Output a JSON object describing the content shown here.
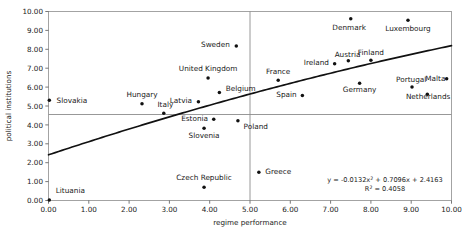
{
  "chart_data": {
    "type": "scatter",
    "title": "",
    "xlabel": "regime performance",
    "ylabel": "political institutions",
    "xlim": [
      0,
      10
    ],
    "ylim": [
      0,
      10
    ],
    "xticks": [
      "0.00",
      "1.00",
      "2.00",
      "3.00",
      "4.00",
      "5.00",
      "6.00",
      "7.00",
      "8.00",
      "9.00",
      "10.00"
    ],
    "yticks": [
      "0.00",
      "1.00",
      "2.00",
      "3.00",
      "4.00",
      "5.00",
      "6.00",
      "7.00",
      "8.00",
      "9.00",
      "10.00"
    ],
    "grid": false,
    "legend": "none",
    "points": [
      {
        "label": "Lituania",
        "x": 0.02,
        "y": 0.02,
        "lx": 0.18,
        "ly": 0.52,
        "anchor": "start"
      },
      {
        "label": "Slovakia",
        "x": 0.02,
        "y": 5.3,
        "lx": 0.2,
        "ly": 5.3,
        "anchor": "start"
      },
      {
        "label": "Hungary",
        "x": 2.32,
        "y": 5.12,
        "lx": 2.32,
        "ly": 5.62,
        "anchor": "middle"
      },
      {
        "label": "Italy",
        "x": 2.86,
        "y": 4.62,
        "lx": 2.9,
        "ly": 5.08,
        "anchor": "middle"
      },
      {
        "label": "Latvia",
        "x": 3.72,
        "y": 5.22,
        "lx": 3.56,
        "ly": 5.27,
        "anchor": "end"
      },
      {
        "label": "Estonia",
        "x": 4.1,
        "y": 4.3,
        "lx": 3.96,
        "ly": 4.36,
        "anchor": "end"
      },
      {
        "label": "Slovenia",
        "x": 3.86,
        "y": 3.82,
        "lx": 3.86,
        "ly": 3.42,
        "anchor": "middle"
      },
      {
        "label": "Czech Republic",
        "x": 3.86,
        "y": 0.7,
        "lx": 3.86,
        "ly": 1.22,
        "anchor": "middle"
      },
      {
        "label": "Poland",
        "x": 4.7,
        "y": 4.22,
        "lx": 4.84,
        "ly": 3.92,
        "anchor": "start"
      },
      {
        "label": "United Kingdom",
        "x": 3.96,
        "y": 6.48,
        "lx": 3.96,
        "ly": 6.96,
        "anchor": "middle"
      },
      {
        "label": "Belgium",
        "x": 4.24,
        "y": 5.72,
        "lx": 4.4,
        "ly": 5.9,
        "anchor": "start"
      },
      {
        "label": "Sweden",
        "x": 4.66,
        "y": 8.18,
        "lx": 4.5,
        "ly": 8.24,
        "anchor": "end"
      },
      {
        "label": "Greece",
        "x": 5.22,
        "y": 1.5,
        "lx": 5.38,
        "ly": 1.54,
        "anchor": "start"
      },
      {
        "label": "France",
        "x": 5.7,
        "y": 6.36,
        "lx": 5.7,
        "ly": 6.82,
        "anchor": "middle"
      },
      {
        "label": "Spain",
        "x": 6.3,
        "y": 5.56,
        "lx": 6.16,
        "ly": 5.6,
        "anchor": "end"
      },
      {
        "label": "Ireland",
        "x": 7.1,
        "y": 7.24,
        "lx": 6.96,
        "ly": 7.28,
        "anchor": "end"
      },
      {
        "label": "Austria",
        "x": 7.44,
        "y": 7.4,
        "lx": 7.42,
        "ly": 7.72,
        "anchor": "middle"
      },
      {
        "label": "Denmark",
        "x": 7.5,
        "y": 9.62,
        "lx": 7.46,
        "ly": 9.16,
        "anchor": "middle"
      },
      {
        "label": "Finland",
        "x": 8.0,
        "y": 7.42,
        "lx": 8.0,
        "ly": 7.84,
        "anchor": "middle"
      },
      {
        "label": "Germany",
        "x": 7.72,
        "y": 6.2,
        "lx": 7.72,
        "ly": 5.86,
        "anchor": "middle"
      },
      {
        "label": "Luxembourg",
        "x": 8.92,
        "y": 9.54,
        "lx": 8.92,
        "ly": 9.08,
        "anchor": "middle"
      },
      {
        "label": "Portugal",
        "x": 9.02,
        "y": 6.0,
        "lx": 9.0,
        "ly": 6.4,
        "anchor": "middle"
      },
      {
        "label": "Malta",
        "x": 9.88,
        "y": 6.44,
        "lx": 9.6,
        "ly": 6.44,
        "anchor": "middle"
      },
      {
        "label": "Netherlands",
        "x": 9.4,
        "y": 5.62,
        "lx": 9.42,
        "ly": 5.5,
        "anchor": "middle"
      }
    ],
    "trendline": {
      "equation": "y = -0.0132x² + 0.7096x + 2.4163",
      "r_squared": "R² = 0.4058",
      "coefficients": {
        "a": -0.0132,
        "b": 0.7096,
        "c": 2.4163
      },
      "r2_value": 0.4058
    },
    "reference_lines": {
      "horizontal_y": 4.55,
      "vertical_x": 5.0
    }
  }
}
